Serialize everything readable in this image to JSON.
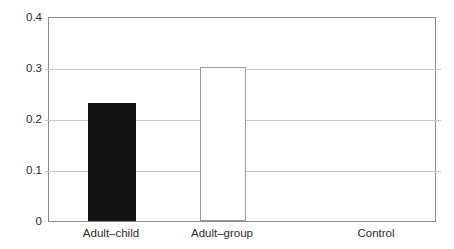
{
  "chart_data": {
    "type": "bar",
    "title": "",
    "subtitle": "",
    "xlabel": "",
    "ylabel": "",
    "categories": [
      "Adult–child",
      "Adult–group",
      "Control"
    ],
    "values": [
      0.232,
      0.303,
      0.0
    ],
    "series": [
      {
        "name": "",
        "values": [
          0.232,
          0.303,
          0.0
        ]
      }
    ],
    "bar_styles": [
      "filled-black",
      "hollow-white",
      "none"
    ],
    "ylim": [
      0,
      0.4
    ],
    "xlim": [
      0,
      3
    ],
    "yticks": [
      0,
      0.1,
      0.2,
      0.3,
      0.4
    ],
    "ytick_labels": [
      "0",
      "0.1",
      "0.2",
      "0.3",
      "0.4"
    ],
    "grid": true,
    "grid_axis": "y",
    "legend": false,
    "legend_position": "none",
    "annotations": []
  },
  "colors": {
    "bar_filled": "#111111",
    "bar_hollow_fill": "#ffffff",
    "bar_hollow_edge": "#9a9a9a",
    "gridline": "#c9c9c9",
    "frame": "#8b8b8b",
    "text": "#2b2b2b",
    "background": "#ffffff"
  }
}
